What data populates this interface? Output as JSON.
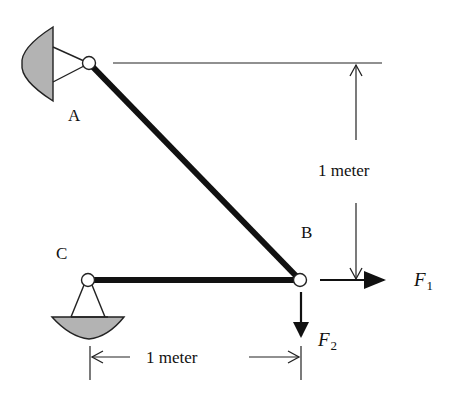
{
  "diagram": {
    "type": "two-member truss / pin-jointed frame",
    "colors": {
      "member": "#111111",
      "support_fill": "#b3b3b3",
      "line": "#222222",
      "node_fill": "#ffffff"
    },
    "nodes": {
      "A": {
        "label": "A",
        "x": 89,
        "y": 63
      },
      "B": {
        "label": "B",
        "x": 300,
        "y": 280
      },
      "C": {
        "label": "C",
        "x": 88,
        "y": 280
      }
    },
    "members": [
      {
        "from": "A",
        "to": "B"
      },
      {
        "from": "C",
        "to": "B"
      }
    ],
    "supports": [
      {
        "node": "A",
        "type": "pin",
        "orientation": "wall-left"
      },
      {
        "node": "C",
        "type": "pin",
        "orientation": "ground-below"
      }
    ],
    "forces": [
      {
        "name": "F",
        "subscript": "1",
        "direction": "right",
        "at": "B"
      },
      {
        "name": "F",
        "subscript": "2",
        "direction": "down",
        "at": "B"
      }
    ],
    "dimensions": {
      "vertical": {
        "label": "1 meter",
        "between": [
          "A",
          "B"
        ]
      },
      "horizontal": {
        "label": "1 meter",
        "between": [
          "C",
          "B"
        ]
      }
    }
  }
}
